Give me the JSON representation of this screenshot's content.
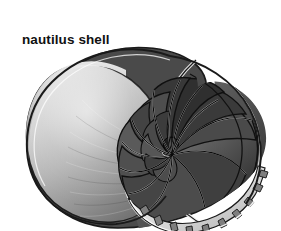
{
  "figure": {
    "caption": "nautilus shell",
    "background_color": "#ffffff",
    "caption_color": "#111111",
    "palette": {
      "outline": "#1a1a1a",
      "body_chamber_light": "#d8d8d8",
      "body_chamber_mid": "#a8a8a8",
      "body_chamber_dark": "#6e6e6e",
      "septa_dark": "#3a3a3a",
      "chamber_fill": "#555555",
      "chamber_fill_deep": "#2b2b2b",
      "rim_highlight": "#f2f2f2",
      "scallop_edge": "#e8e8e8"
    },
    "geometry": {
      "spiral_center_x": 172,
      "spiral_center_y": 155,
      "shell_left": 25,
      "shell_right": 268,
      "shell_top": 50,
      "shell_bottom": 228,
      "chamber_count": 14,
      "scallop_count": 11
    }
  }
}
